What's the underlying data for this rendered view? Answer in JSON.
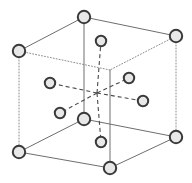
{
  "figure": {
    "kind": "crystal-lattice-unit-cell",
    "title": "",
    "caption": "",
    "width": 192,
    "height": 183,
    "background_color": "#ffffff"
  },
  "style": {
    "edge_solid_color": "#6e6e6e",
    "edge_hidden_color": "#8c8c8c",
    "bond_dashed_color": "#4a4a4a",
    "atom_stroke_color": "#3a3a3a",
    "atom_fill_color": "#e8e8e8",
    "corner_atom_radius": 6.2,
    "interior_atom_radius": 5.2,
    "edge_stroke_width": 1.0,
    "hidden_stroke_width": 1.0,
    "atom_stroke_width": 2.0,
    "hidden_dash_pattern": "1,2",
    "bond_dash_pattern": "4,3"
  },
  "geometry": {
    "center": {
      "x": 97,
      "y": 93
    },
    "vertices": {
      "top_back_left": {
        "x": 19,
        "y": 51,
        "hidden": false
      },
      "top_back_right": {
        "x": 84,
        "y": 17,
        "hidden": false
      },
      "top_front_right": {
        "x": 176,
        "y": 36,
        "hidden": false
      },
      "top_front_left": {
        "x": 110,
        "y": 70,
        "hidden": true
      },
      "bot_back_left": {
        "x": 19,
        "y": 152,
        "hidden": false
      },
      "bot_back_right": {
        "x": 84,
        "y": 119,
        "hidden": false
      },
      "bot_front_right": {
        "x": 176,
        "y": 137,
        "hidden": false
      },
      "bot_front_left": {
        "x": 110,
        "y": 168,
        "hidden": false
      }
    }
  },
  "edges": [
    {
      "name": "edge-top-back-left-to-top-back-right",
      "x1": 19,
      "y1": 51,
      "x2": 84,
      "y2": 17,
      "hidden": false
    },
    {
      "name": "edge-top-back-right-to-top-front-right",
      "x1": 84,
      "y1": 17,
      "x2": 176,
      "y2": 36,
      "hidden": false
    },
    {
      "name": "edge-top-front-right-to-top-front-left",
      "x1": 176,
      "y1": 36,
      "x2": 110,
      "y2": 70,
      "hidden": true
    },
    {
      "name": "edge-top-front-left-to-top-back-left",
      "x1": 110,
      "y1": 70,
      "x2": 19,
      "y2": 51,
      "hidden": true
    },
    {
      "name": "edge-bot-back-left-to-bot-back-right",
      "x1": 19,
      "y1": 152,
      "x2": 84,
      "y2": 119,
      "hidden": false
    },
    {
      "name": "edge-bot-back-right-to-bot-front-right",
      "x1": 84,
      "y1": 119,
      "x2": 176,
      "y2": 137,
      "hidden": false
    },
    {
      "name": "edge-bot-front-right-to-bot-front-left",
      "x1": 176,
      "y1": 137,
      "x2": 110,
      "y2": 168,
      "hidden": false
    },
    {
      "name": "edge-bot-front-left-to-bot-back-left",
      "x1": 110,
      "y1": 168,
      "x2": 19,
      "y2": 152,
      "hidden": false
    },
    {
      "name": "edge-vertical-back-left",
      "x1": 19,
      "y1": 51,
      "x2": 19,
      "y2": 152,
      "hidden": true
    },
    {
      "name": "edge-vertical-back-right",
      "x1": 84,
      "y1": 17,
      "x2": 84,
      "y2": 119,
      "hidden": false
    },
    {
      "name": "edge-vertical-front-right",
      "x1": 176,
      "y1": 36,
      "x2": 176,
      "y2": 137,
      "hidden": true
    },
    {
      "name": "edge-vertical-front-left",
      "x1": 110,
      "y1": 70,
      "x2": 110,
      "y2": 168,
      "hidden": false
    }
  ],
  "bonds": [
    {
      "name": "bond-center-to-upper-face",
      "x1": 97,
      "y1": 93,
      "x2": 101,
      "y2": 41
    },
    {
      "name": "bond-center-to-lower-face",
      "x1": 97,
      "y1": 93,
      "x2": 101,
      "y2": 142
    },
    {
      "name": "bond-center-to-left-face",
      "x1": 97,
      "y1": 93,
      "x2": 50,
      "y2": 83
    },
    {
      "name": "bond-center-to-right-face",
      "x1": 97,
      "y1": 93,
      "x2": 143,
      "y2": 101
    },
    {
      "name": "bond-center-to-upper-right-face",
      "x1": 97,
      "y1": 93,
      "x2": 129,
      "y2": 78
    },
    {
      "name": "bond-center-to-lower-left-face",
      "x1": 97,
      "y1": 93,
      "x2": 60,
      "y2": 113
    }
  ],
  "atoms": {
    "corner": [
      {
        "name": "atom-corner-top-back-left",
        "x": 19,
        "y": 51
      },
      {
        "name": "atom-corner-top-back-right",
        "x": 84,
        "y": 17
      },
      {
        "name": "atom-corner-top-front-right",
        "x": 176,
        "y": 36
      },
      {
        "name": "atom-corner-bot-back-left",
        "x": 19,
        "y": 152
      },
      {
        "name": "atom-corner-bot-back-right",
        "x": 84,
        "y": 119
      },
      {
        "name": "atom-corner-bot-front-right",
        "x": 176,
        "y": 137
      },
      {
        "name": "atom-corner-bot-front-left",
        "x": 110,
        "y": 168
      }
    ],
    "interior": [
      {
        "name": "atom-face-upper",
        "x": 101,
        "y": 41
      },
      {
        "name": "atom-face-upper-right",
        "x": 129,
        "y": 78
      },
      {
        "name": "atom-face-right",
        "x": 143,
        "y": 101
      },
      {
        "name": "atom-face-left",
        "x": 50,
        "y": 83
      },
      {
        "name": "atom-face-lower-left",
        "x": 60,
        "y": 113
      },
      {
        "name": "atom-face-lower",
        "x": 101,
        "y": 142
      }
    ]
  },
  "counts": {
    "corner_atoms": 7,
    "interior_atoms": 6,
    "total_edges": 12,
    "total_bonds": 6
  }
}
